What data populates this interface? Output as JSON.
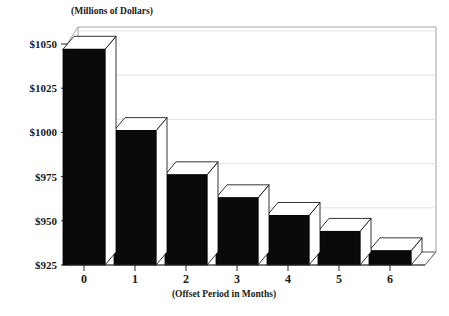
{
  "chart_data": {
    "type": "bar",
    "title": "",
    "subtitle": "",
    "unit_note": "(Millions of Dollars)",
    "xlabel": "(Offset Period in Months)",
    "ylabel": "",
    "categories": [
      "0",
      "1",
      "2",
      "3",
      "4",
      "5",
      "6"
    ],
    "values": [
      1047,
      1001,
      976,
      963,
      953,
      944,
      933
    ],
    "ytick_labels": [
      "$1050",
      "$1025",
      "$1000",
      "$975",
      "$950",
      "$925"
    ],
    "ytick_values": [
      1050,
      1025,
      1000,
      975,
      950,
      925
    ],
    "ylim": [
      925,
      1057
    ],
    "grid": true,
    "legend": null,
    "style": "3d-column",
    "bar_color": "#0a0a0a",
    "bar_highlight_color": "#ffffff",
    "gridline_color": "#d8d8d8",
    "axis_color": "#2b2b2b",
    "background": "#ffffff"
  },
  "labels": {
    "unit_note": "(Millions of Dollars)",
    "x_axis_title": "(Offset Period in Months)"
  }
}
